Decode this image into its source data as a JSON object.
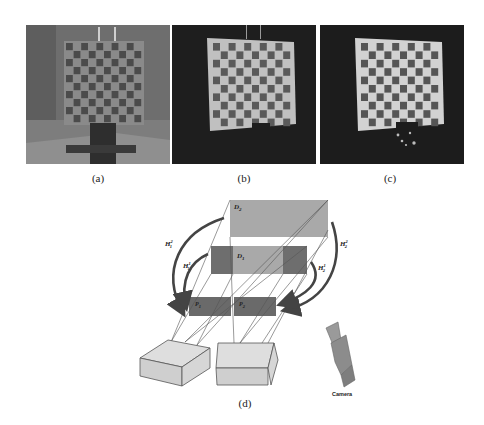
{
  "photos": [
    {
      "id": "a",
      "caption": "(a)",
      "scene": "checkerboard under ambient light",
      "background": "#6b6b6b",
      "board_bg": "#8a8a8a",
      "dark_square": "#4a4a4a"
    },
    {
      "id": "b",
      "caption": "(b)",
      "scene": "checkerboard lit by projector, dark surroundings",
      "background": "#1e1e1e",
      "board_bg": "#bdbdbd",
      "dark_square": "#5a5a5a"
    },
    {
      "id": "c",
      "caption": "(c)",
      "scene": "checkerboard lit by projector, dark surroundings",
      "background": "#1c1c1c",
      "board_bg": "#d2d2d2",
      "dark_square": "#555555"
    }
  ],
  "diagram": {
    "caption": "(d)",
    "planes": {
      "D2": {
        "label": "D",
        "sub": "2",
        "fill": "#a9a9a9"
      },
      "D1": {
        "label": "D",
        "sub": "1",
        "outer_fill": "#6e6e6e",
        "inner_fill": "#a9a9a9"
      },
      "P1": {
        "label": "P",
        "sub": "1",
        "fill": "#6a6a6a"
      },
      "P2": {
        "label": "P",
        "sub": "2",
        "fill": "#6a6a6a"
      }
    },
    "homographies": [
      {
        "name": "H",
        "sup": "2",
        "sub": "1",
        "position": "left-outer"
      },
      {
        "name": "H",
        "sup": "1",
        "sub": "1",
        "position": "left-inner"
      },
      {
        "name": "H",
        "sup": "2",
        "sub": "2",
        "position": "right-outer"
      },
      {
        "name": "H",
        "sup": "1",
        "sub": "2",
        "position": "right-inner"
      }
    ],
    "projectors": [
      {
        "name": "projector-1",
        "fill": "#d8d8d8"
      },
      {
        "name": "projector-2",
        "fill": "#d8d8d8"
      }
    ],
    "camera": {
      "label": "Camera",
      "fill": "#8c8c8c"
    },
    "colors": {
      "line": "#555555",
      "arrow": "#444444"
    }
  }
}
